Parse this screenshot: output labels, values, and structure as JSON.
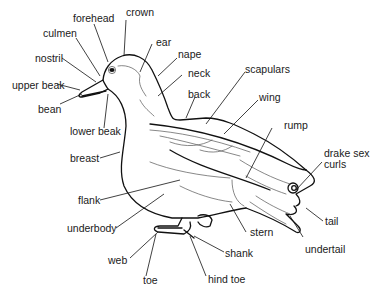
{
  "diagram": {
    "labels": {
      "crown": "crown",
      "forehead": "forehead",
      "culmen": "culmen",
      "ear": "ear",
      "nostril": "nostril",
      "nape": "nape",
      "neck": "neck",
      "upper_beak": "upper beak",
      "bean": "bean",
      "back": "back",
      "scapulars": "scapulars",
      "wing": "wing",
      "lower_beak": "lower beak",
      "rump": "rump",
      "breast": "breast",
      "drake_sex_curls_1": "drake sex",
      "drake_sex_curls_2": "curls",
      "flank": "flank",
      "underbody": "underbody",
      "tail": "tail",
      "stern": "stern",
      "undertail": "undertail",
      "web": "web",
      "shank": "shank",
      "toe": "toe",
      "hind_toe": "hind toe"
    }
  }
}
